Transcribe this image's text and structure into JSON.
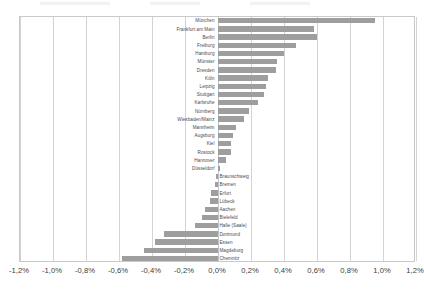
{
  "chart_data": {
    "type": "bar",
    "orientation": "horizontal",
    "title": "",
    "xlabel": "",
    "ylabel": "",
    "xlim": [
      -1.2,
      1.2
    ],
    "grid": true,
    "legend": false,
    "value_suffix": "%",
    "decimal_separator": ",",
    "bar_color": "#9e9e9e",
    "xticks": [
      {
        "value": -1.2,
        "label": "-1,2%"
      },
      {
        "value": -1.0,
        "label": "-1,0%"
      },
      {
        "value": -0.8,
        "label": "-0,8%"
      },
      {
        "value": -0.6,
        "label": "-0,6%"
      },
      {
        "value": -0.4,
        "label": "-0,4%"
      },
      {
        "value": -0.2,
        "label": "-0,2%"
      },
      {
        "value": 0.0,
        "label": "0,0%"
      },
      {
        "value": 0.2,
        "label": "0,2%"
      },
      {
        "value": 0.4,
        "label": "0,4%"
      },
      {
        "value": 0.6,
        "label": "0,6%"
      },
      {
        "value": 0.8,
        "label": "0,8%"
      },
      {
        "value": 1.0,
        "label": "1,0%"
      },
      {
        "value": 1.2,
        "label": "1,2%"
      }
    ],
    "categories": [
      "München",
      "Frankfurt am Main",
      "Berlin",
      "Freiburg",
      "Hamburg",
      "Münster",
      "Dresden",
      "Köln",
      "Leipzig",
      "Stuttgart",
      "Karlsruhe",
      "Nürnberg",
      "Wiesbaden/Mainz",
      "Mannheim",
      "Augsburg",
      "Kiel",
      "Rostock",
      "Hannover",
      "Düsseldorf",
      "Braunschweig",
      "Bremen",
      "Erfurt",
      "Lübeck",
      "Aachen",
      "Bielefeld",
      "Halle (Saale)",
      "Dortmund",
      "Essen",
      "Magdeburg",
      "Chemnitz"
    ],
    "values": [
      0.95,
      0.58,
      0.6,
      0.47,
      0.4,
      0.36,
      0.35,
      0.3,
      0.29,
      0.28,
      0.24,
      0.19,
      0.16,
      0.11,
      0.09,
      0.08,
      0.08,
      0.05,
      0.01,
      -0.01,
      -0.02,
      -0.04,
      -0.05,
      -0.08,
      -0.1,
      -0.14,
      -0.33,
      -0.38,
      -0.45,
      -0.58
    ]
  }
}
